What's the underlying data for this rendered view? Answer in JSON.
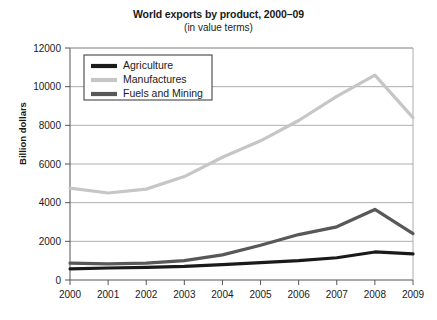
{
  "chart_data": {
    "type": "line",
    "title": "World exports by product, 2000–09",
    "subtitle": "(in value terms)",
    "xlabel": "",
    "ylabel": "Billion dollars",
    "categories": [
      "2000",
      "2001",
      "2002",
      "2003",
      "2004",
      "2005",
      "2006",
      "2007",
      "2008",
      "2009"
    ],
    "x": [
      2000,
      2001,
      2002,
      2003,
      2004,
      2005,
      2006,
      2007,
      2008,
      2009
    ],
    "ylim": [
      0,
      12000
    ],
    "yticks": [
      0,
      2000,
      4000,
      6000,
      8000,
      10000,
      12000
    ],
    "ytick_labels": [
      "0",
      "2000",
      "4000",
      "6000",
      "8000",
      "10000",
      "12000"
    ],
    "grid": true,
    "legend_position": "top-left",
    "series": [
      {
        "name": "Agriculture",
        "color": "#1a1a1a",
        "values": [
          580,
          620,
          650,
          700,
          800,
          900,
          1000,
          1150,
          1450,
          1350
        ]
      },
      {
        "name": "Manufactures",
        "color": "#c6c6c6",
        "values": [
          4750,
          4500,
          4700,
          5350,
          6350,
          7200,
          8250,
          9500,
          10600,
          8400
        ]
      },
      {
        "name": "Fuels and Mining",
        "color": "#585858",
        "values": [
          870,
          830,
          870,
          1000,
          1300,
          1800,
          2350,
          2750,
          3650,
          2400
        ]
      }
    ]
  },
  "axes": {
    "left_px": 70,
    "right_px": 413,
    "top_px": 48,
    "bottom_px": 280
  },
  "legend": {
    "box": {
      "x": 84,
      "y": 55,
      "width": 128,
      "height": 45
    }
  }
}
